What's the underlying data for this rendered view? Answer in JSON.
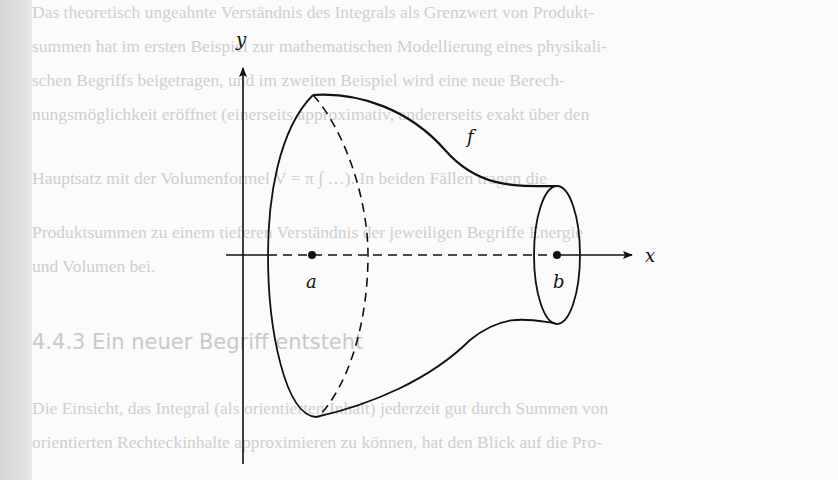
{
  "figure": {
    "axis_labels": {
      "x": "x",
      "y": "y"
    },
    "points": {
      "a": "a",
      "b": "b"
    },
    "function_label": "f"
  },
  "bleed_through_text": [
    "Das theoretisch ungeahnte Verständnis des Integrals als Grenzwert von Produkt-",
    "summen hat im ersten Beispiel zur mathematischen Modellierung eines physikali-",
    "schen Begriffs beigetragen, und im zweiten Beispiel wird eine neue Berech-",
    "nungsmöglichkeit eröffnet (einerseits approximativ, andererseits exakt über den",
    "Hauptsatz mit der Volumenformel V = π ∫ …). In beiden Fällen tragen die",
    "Produktsummen zu einem tieferen Verständnis der jeweiligen Begriffe Energie",
    "und Volumen bei.",
    "4.4.3   Ein neuer Begriff entsteht",
    "Die Einsicht, das Integral (als orientierten Inhalt) jederzeit gut durch Summen von",
    "orientierten Rechteckinhalte approximieren zu können, hat den Blick auf die Pro-"
  ]
}
